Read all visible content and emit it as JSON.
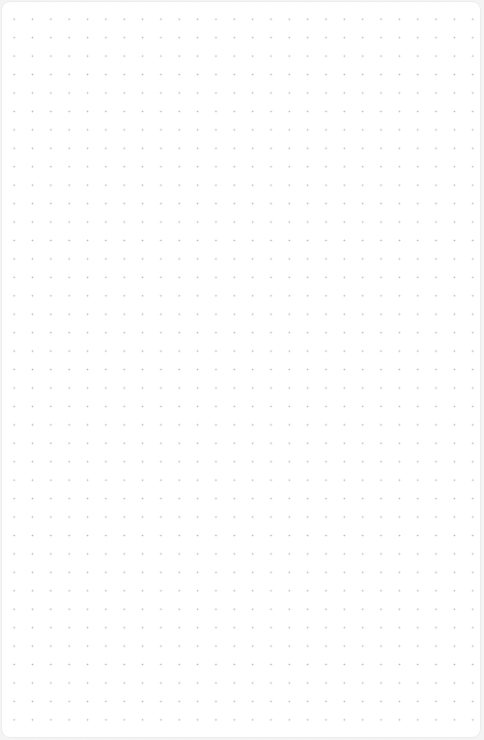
{
  "canvas": {
    "type": "dot-grid",
    "background_color": "#ffffff",
    "dot_color": "#b8b8b8",
    "dot_spacing_x": 18.35,
    "dot_spacing_y": 18.45
  }
}
